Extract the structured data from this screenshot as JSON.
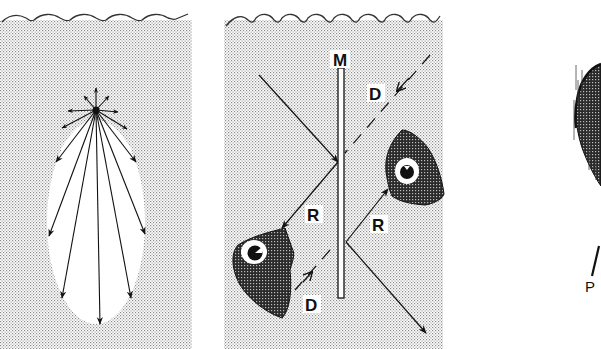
{
  "figure": {
    "panels": [
      {
        "id": "a",
        "description": "Light rays radiating from a point source below the water surface",
        "rays": 13
      },
      {
        "id": "b",
        "labels": {
          "mirror": "M",
          "direct_upper": "D",
          "direct_lower": "D",
          "reflected_left": "R",
          "reflected_right": "R"
        }
      },
      {
        "id": "c",
        "labels": {
          "pointer": "P"
        }
      }
    ],
    "colors": {
      "ink": "#111111",
      "water_stipple": "#d8d8d8",
      "fish_body": "#333333",
      "background": "#ffffff"
    }
  }
}
